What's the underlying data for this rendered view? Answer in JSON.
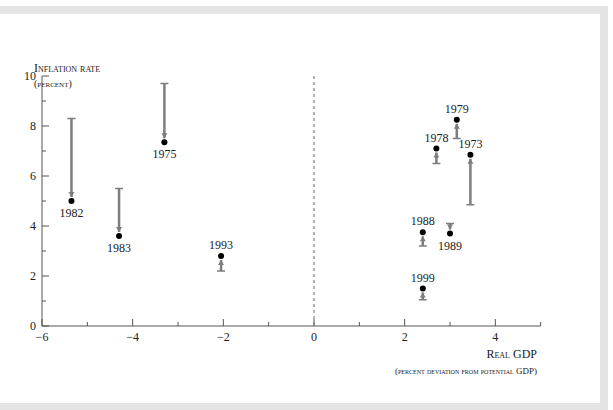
{
  "chart_data": {
    "type": "scatter",
    "title": "",
    "ylabel": "Inflation rate",
    "ylabel_sub": "(percent)",
    "xlabel": "Real GDP",
    "xlabel_sub": "(percent deviation from potential GDP)",
    "xlim": [
      -6,
      5
    ],
    "ylim": [
      0,
      10
    ],
    "x_ticks": [
      -6,
      -4,
      -2,
      0,
      2,
      4
    ],
    "x_tick_labels": [
      "−6",
      "−4",
      "−2",
      "0",
      "2",
      "4"
    ],
    "x_minor_ticks": [
      -5,
      -3,
      -1,
      1,
      3,
      5
    ],
    "y_ticks": [
      0,
      2,
      4,
      6,
      8,
      10
    ],
    "y_tick_labels": [
      "0",
      "2",
      "4",
      "6",
      "8",
      "10"
    ],
    "y_minor_ticks": [
      1,
      3,
      5,
      7,
      9
    ],
    "reference_line": {
      "x": 0,
      "style": "dashed"
    },
    "grid": false,
    "points": [
      {
        "label": "1982",
        "x": -5.35,
        "y": 5.0,
        "arrow_from": 8.3,
        "label_pos": "below"
      },
      {
        "label": "1983",
        "x": -4.3,
        "y": 3.6,
        "arrow_from": 5.5,
        "label_pos": "below"
      },
      {
        "label": "1975",
        "x": -3.3,
        "y": 7.35,
        "arrow_from": 9.7,
        "label_pos": "below"
      },
      {
        "label": "1993",
        "x": -2.05,
        "y": 2.8,
        "arrow_from": 2.2,
        "label_pos": "above"
      },
      {
        "label": "1999",
        "x": 2.4,
        "y": 1.5,
        "arrow_from": 1.05,
        "label_pos": "above"
      },
      {
        "label": "1988",
        "x": 2.4,
        "y": 3.75,
        "arrow_from": 3.2,
        "label_pos": "above"
      },
      {
        "label": "1989",
        "x": 3.0,
        "y": 3.7,
        "arrow_from": 4.1,
        "label_pos": "below"
      },
      {
        "label": "1978",
        "x": 2.7,
        "y": 7.1,
        "arrow_from": 6.5,
        "label_pos": "above"
      },
      {
        "label": "1979",
        "x": 3.15,
        "y": 8.25,
        "arrow_from": 7.5,
        "label_pos": "above"
      },
      {
        "label": "1973",
        "x": 3.45,
        "y": 6.85,
        "arrow_from": 4.85,
        "label_pos": "above"
      }
    ]
  },
  "colors": {
    "arrow": "#7d7d7d",
    "dot": "#000000",
    "axis": "#555555",
    "frame": "#e4e4e4"
  },
  "labels": {
    "y_axis_title": "Inflation rate",
    "y_axis_subtitle": "(percent)",
    "x_axis_title": "Real GDP",
    "x_axis_subtitle": "(percent deviation from potential GDP)"
  }
}
